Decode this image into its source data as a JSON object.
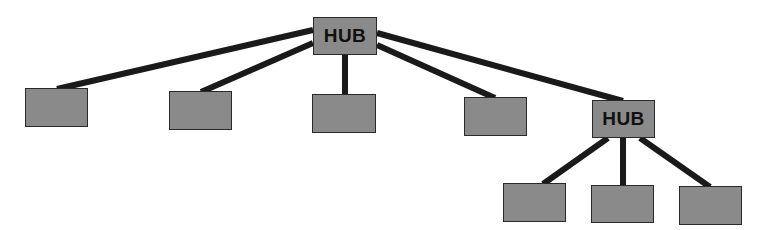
{
  "diagram": {
    "type": "hierarchical-star-topology",
    "colors": {
      "node_fill": "#8a8a8a",
      "node_border": "#2a2a2a",
      "link": "#1a1a1a",
      "background": "#ffffff"
    },
    "nodes": [
      {
        "id": "hub1",
        "label": "HUB",
        "x": 313,
        "y": 17,
        "w": 64,
        "h": 38
      },
      {
        "id": "n1",
        "label": "",
        "x": 25,
        "y": 88,
        "w": 63,
        "h": 39
      },
      {
        "id": "n2",
        "label": "",
        "x": 169,
        "y": 91,
        "w": 63,
        "h": 39
      },
      {
        "id": "n3",
        "label": "",
        "x": 312,
        "y": 94,
        "w": 64,
        "h": 39
      },
      {
        "id": "n4",
        "label": "",
        "x": 464,
        "y": 97,
        "w": 63,
        "h": 39
      },
      {
        "id": "hub2",
        "label": "HUB",
        "x": 592,
        "y": 100,
        "w": 63,
        "h": 38
      },
      {
        "id": "n5",
        "label": "",
        "x": 503,
        "y": 183,
        "w": 63,
        "h": 39
      },
      {
        "id": "n6",
        "label": "",
        "x": 591,
        "y": 185,
        "w": 63,
        "h": 38
      },
      {
        "id": "n7",
        "label": "",
        "x": 679,
        "y": 186,
        "w": 63,
        "h": 39
      }
    ],
    "edges": [
      {
        "from": "hub1",
        "to": "n1",
        "x1": 313,
        "y1": 30,
        "x2": 57,
        "y2": 89
      },
      {
        "from": "hub1",
        "to": "n2",
        "x1": 313,
        "y1": 43,
        "x2": 201,
        "y2": 92
      },
      {
        "from": "hub1",
        "to": "n3",
        "x1": 345,
        "y1": 55,
        "x2": 345,
        "y2": 95
      },
      {
        "from": "hub1",
        "to": "n4",
        "x1": 377,
        "y1": 45,
        "x2": 495,
        "y2": 98
      },
      {
        "from": "hub1",
        "to": "hub2",
        "x1": 377,
        "y1": 33,
        "x2": 623,
        "y2": 101
      },
      {
        "from": "hub2",
        "to": "n5",
        "x1": 608,
        "y1": 138,
        "x2": 543,
        "y2": 184
      },
      {
        "from": "hub2",
        "to": "n6",
        "x1": 623,
        "y1": 138,
        "x2": 623,
        "y2": 186
      },
      {
        "from": "hub2",
        "to": "n7",
        "x1": 640,
        "y1": 138,
        "x2": 710,
        "y2": 187
      }
    ]
  }
}
